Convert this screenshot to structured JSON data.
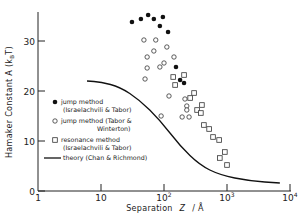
{
  "chart_data": {
    "type": "scatter",
    "title": "",
    "xlabel": "Separation Z / Å",
    "ylabel": "Hamaker Constant A (k_BT)",
    "xscale": "log",
    "xlim": [
      1,
      10000
    ],
    "ylim": [
      0,
      35.6
    ],
    "xticks": [
      {
        "value": 1,
        "label": "1",
        "sup": ""
      },
      {
        "value": 10,
        "label": "10",
        "sup": ""
      },
      {
        "value": 100,
        "label": "10",
        "sup": "2"
      },
      {
        "value": 1000,
        "label": "10",
        "sup": "3"
      },
      {
        "value": 10000,
        "label": "10",
        "sup": "4"
      }
    ],
    "yticks": [
      0,
      10,
      20,
      30
    ],
    "grid": false,
    "legend_position": "left-center",
    "series": [
      {
        "name": "jump method (Israelachvili & Tabor)",
        "marker": "filled-circle",
        "points": [
          [
            31,
            33.8
          ],
          [
            43,
            34.4
          ],
          [
            56,
            35.2
          ],
          [
            69,
            34.4
          ],
          [
            96,
            34.8
          ],
          [
            86,
            33.0
          ],
          [
            116,
            31.8
          ],
          [
            155,
            24.8
          ],
          [
            180,
            22.2
          ],
          [
            208,
            21.6
          ]
        ]
      },
      {
        "name": "jump method (Tabor & Winterton)",
        "marker": "open-circle",
        "points": [
          [
            48,
            30.2
          ],
          [
            74,
            30.2
          ],
          [
            69,
            28.0
          ],
          [
            111,
            28.8
          ],
          [
            54,
            26.8
          ],
          [
            144,
            26.8
          ],
          [
            100,
            25.6
          ],
          [
            54,
            24.6
          ],
          [
            86,
            24.8
          ],
          [
            50,
            22.4
          ],
          [
            120,
            19.0
          ],
          [
            215,
            18.4
          ],
          [
            230,
            17.0
          ],
          [
            230,
            16.2
          ],
          [
            194,
            14.8
          ],
          [
            250,
            14.8
          ],
          [
            90,
            15.0
          ]
        ]
      },
      {
        "name": "resonance method (Israelachvili & Tabor)",
        "marker": "open-square",
        "points": [
          [
            140,
            22.8
          ],
          [
            208,
            23.2
          ],
          [
            150,
            21.2
          ],
          [
            300,
            19.6
          ],
          [
            260,
            18.6
          ],
          [
            400,
            17.2
          ],
          [
            335,
            16.2
          ],
          [
            385,
            15.6
          ],
          [
            430,
            13.2
          ],
          [
            520,
            12.4
          ],
          [
            600,
            10.8
          ],
          [
            750,
            10.2
          ],
          [
            925,
            7.8
          ],
          [
            770,
            6.6
          ],
          [
            1000,
            5.2
          ]
        ]
      },
      {
        "name": "theory (Chan & Richmond)",
        "marker": "line",
        "points": [
          [
            6,
            22.0
          ],
          [
            10,
            21.8
          ],
          [
            20,
            20.8
          ],
          [
            41,
            18.2
          ],
          [
            86,
            14.2
          ],
          [
            180,
            9.0
          ],
          [
            370,
            5.2
          ],
          [
            770,
            3.2
          ],
          [
            2300,
            2.0
          ],
          [
            6900,
            1.6
          ]
        ]
      }
    ],
    "legend": [
      {
        "line1": "jump method",
        "line2": "(Israelachvili & Tabor)"
      },
      {
        "line1": "jump method (Tabor &",
        "line2": "Winterton)"
      },
      {
        "line1": "resonance method",
        "line2": "(Israelachvili & Tabor)"
      },
      {
        "line1": "theory (Chan & Richmond)",
        "line2": ""
      }
    ]
  },
  "axes": {
    "x_label_text": "Separation",
    "x_label_symbol": "Z",
    "x_label_unit": "/ Å",
    "y_label_main": "Hamaker Constant A (k",
    "y_label_sub": "B",
    "y_label_end": "T)"
  }
}
